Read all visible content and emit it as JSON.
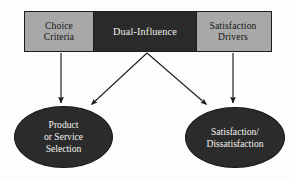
{
  "diagram": {
    "background_color": "#fdfdfc",
    "palette": {
      "gray_fill": "#a8a8a8",
      "dark_fill": "#2a2a2a",
      "outline": "#1c1c1c",
      "dark_text": "#141414",
      "light_text": "#f2f0ec",
      "arrow": "#1a1a1a"
    },
    "top_bar": {
      "segments": [
        {
          "id": "choice-criteria",
          "label": "Choice\nCriteria",
          "fill": "#a8a8a8",
          "text_color": "#141414"
        },
        {
          "id": "dual-influence",
          "label": "Dual-Influence",
          "fill": "#2a2a2a",
          "text_color": "#f2f0ec"
        },
        {
          "id": "satisfaction-drivers",
          "label": "Satisfaction\nDrivers",
          "fill": "#a8a8a8",
          "text_color": "#141414"
        }
      ]
    },
    "outcomes": [
      {
        "id": "product-or-service-selection",
        "label": "Product\nor Service\nSelection",
        "fill": "#2b2b2b",
        "text_color": "#f4f2ee"
      },
      {
        "id": "satisfaction-dissatisfaction",
        "label": "Satisfaction/\nDissatisfaction",
        "fill": "#2b2b2b",
        "text_color": "#f4f2ee"
      }
    ],
    "arrows": [
      {
        "id": "choice-criteria-to-selection",
        "from": "choice-criteria",
        "to": "product-or-service-selection",
        "kind": "vertical",
        "x1": 61,
        "y1": 53,
        "x2": 61,
        "y2": 104
      },
      {
        "id": "dual-influence-to-selection",
        "from": "dual-influence",
        "to": "product-or-service-selection",
        "kind": "diagonal",
        "x1": 147,
        "y1": 53,
        "x2": 90,
        "y2": 106
      },
      {
        "id": "dual-influence-to-satisfaction",
        "from": "dual-influence",
        "to": "satisfaction-dissatisfaction",
        "kind": "diagonal",
        "x1": 147,
        "y1": 53,
        "x2": 208,
        "y2": 106
      },
      {
        "id": "satisfaction-drivers-to-satisfaction",
        "from": "satisfaction-drivers",
        "to": "satisfaction-dissatisfaction",
        "kind": "vertical",
        "x1": 233,
        "y1": 53,
        "x2": 233,
        "y2": 104
      }
    ]
  }
}
